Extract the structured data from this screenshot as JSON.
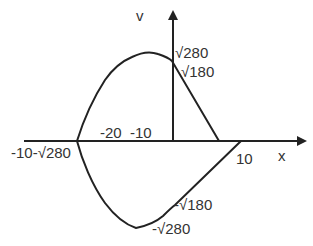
{
  "diagram": {
    "type": "phase-portrait",
    "axes": {
      "x_label": "x",
      "y_label": "v"
    },
    "labels": {
      "y_pos_280": "√280",
      "y_pos_180": "√180",
      "x_neg_20": "-20",
      "x_neg_10": "-10",
      "x_left": "-10-√280",
      "x_pos_10": "10",
      "y_neg_180": "-√180",
      "y_neg_280": "-√280"
    },
    "colors": {
      "line": "#222222",
      "text": "#333333",
      "background": "#ffffff"
    }
  }
}
